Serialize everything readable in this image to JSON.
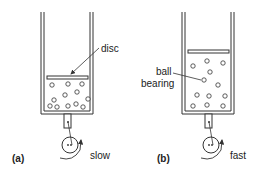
{
  "diagram": {
    "panels": [
      {
        "id": "a",
        "label": "(a)",
        "speed_label": "slow",
        "annotation": "disc"
      },
      {
        "id": "b",
        "label": "(b)",
        "speed_label": "fast",
        "annotation_line1": "ball",
        "annotation_line2": "bearing"
      }
    ],
    "colors": {
      "stroke": "#333333",
      "background": "#ffffff"
    }
  }
}
